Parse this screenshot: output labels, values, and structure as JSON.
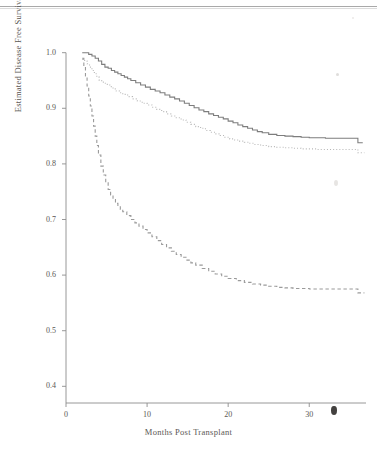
{
  "figure": {
    "name": "kaplan-meier-disease-free-survival",
    "background_color": "#ffffff",
    "artifacts": {
      "page_edge_rule": true,
      "axis_blob_smudge": true
    }
  },
  "chart_data": {
    "type": "line",
    "title": "",
    "subtitle": "",
    "xlabel": "Months Post Transplant",
    "ylabel": "Estimated Disease Free Survival",
    "xlim": [
      0,
      37
    ],
    "ylim": [
      0.37,
      1.03
    ],
    "xticks": [
      0,
      10,
      20,
      30
    ],
    "xtick_labels": [
      "0",
      "10",
      "20",
      "30"
    ],
    "yticks": [
      0.4,
      0.5,
      0.6,
      0.7,
      0.8,
      0.9,
      1.0
    ],
    "ytick_labels": [
      "0.4",
      "0.5",
      "0.6",
      "0.7",
      "0.8",
      "0.9",
      "1.0"
    ],
    "grid": false,
    "legend": "none",
    "step_style": "post",
    "series": [
      {
        "name": "curve-1-solid",
        "style": "solid",
        "color": "#7d7d7d",
        "width": 1.1,
        "x": [
          2.0,
          2.4,
          2.8,
          3.2,
          3.6,
          4.0,
          4.4,
          4.8,
          5.2,
          5.6,
          6.0,
          6.4,
          6.8,
          7.2,
          7.6,
          8.0,
          8.6,
          9.2,
          9.8,
          10.4,
          11.0,
          11.6,
          12.2,
          12.8,
          13.4,
          14.0,
          14.6,
          15.2,
          15.8,
          16.4,
          17.0,
          17.6,
          18.2,
          18.8,
          19.4,
          20.0,
          20.6,
          21.2,
          21.8,
          22.4,
          23.0,
          23.6,
          24.2,
          25.0,
          26.0,
          27.0,
          28.0,
          29.0,
          30.0,
          31.0,
          32.0,
          33.0,
          34.0,
          35.0,
          36.0,
          36.6
        ],
        "y": [
          1.0,
          1.0,
          0.997,
          0.994,
          0.99,
          0.985,
          0.979,
          0.974,
          0.972,
          0.968,
          0.965,
          0.962,
          0.959,
          0.956,
          0.953,
          0.95,
          0.946,
          0.942,
          0.938,
          0.934,
          0.931,
          0.928,
          0.924,
          0.92,
          0.917,
          0.913,
          0.909,
          0.905,
          0.901,
          0.897,
          0.894,
          0.89,
          0.887,
          0.884,
          0.881,
          0.877,
          0.874,
          0.87,
          0.867,
          0.864,
          0.861,
          0.858,
          0.856,
          0.853,
          0.851,
          0.85,
          0.849,
          0.848,
          0.847,
          0.847,
          0.846,
          0.846,
          0.846,
          0.846,
          0.838,
          0.838
        ]
      },
      {
        "name": "curve-2-dotted",
        "style": "dotted",
        "color": "#b6b6b6",
        "width": 1.1,
        "x": [
          2.0,
          2.3,
          2.6,
          2.9,
          3.2,
          3.5,
          3.8,
          4.1,
          4.4,
          4.7,
          5.0,
          5.4,
          5.8,
          6.2,
          6.6,
          7.0,
          7.6,
          8.2,
          8.8,
          9.4,
          10.0,
          10.6,
          11.2,
          11.8,
          12.4,
          13.0,
          13.6,
          14.2,
          14.8,
          15.4,
          16.0,
          16.6,
          17.2,
          17.8,
          18.4,
          19.0,
          19.6,
          20.2,
          20.8,
          21.4,
          22.0,
          22.6,
          23.2,
          24.0,
          25.0,
          26.0,
          27.0,
          28.0,
          29.0,
          30.0,
          31.0,
          32.0,
          33.0,
          34.0,
          35.0,
          36.0,
          36.8
        ],
        "y": [
          0.988,
          0.985,
          0.98,
          0.974,
          0.968,
          0.962,
          0.956,
          0.95,
          0.947,
          0.945,
          0.943,
          0.939,
          0.935,
          0.931,
          0.928,
          0.925,
          0.921,
          0.917,
          0.913,
          0.909,
          0.906,
          0.902,
          0.898,
          0.894,
          0.89,
          0.886,
          0.883,
          0.879,
          0.875,
          0.871,
          0.867,
          0.864,
          0.86,
          0.857,
          0.854,
          0.851,
          0.848,
          0.845,
          0.843,
          0.841,
          0.839,
          0.837,
          0.835,
          0.833,
          0.831,
          0.83,
          0.829,
          0.828,
          0.827,
          0.827,
          0.826,
          0.826,
          0.826,
          0.826,
          0.826,
          0.82,
          0.82
        ]
      },
      {
        "name": "curve-3-dashed",
        "style": "dashed",
        "color": "#9a9a9a",
        "width": 1.1,
        "x": [
          2.0,
          2.2,
          2.4,
          2.6,
          2.8,
          3.0,
          3.2,
          3.4,
          3.6,
          3.8,
          4.0,
          4.3,
          4.6,
          4.9,
          5.2,
          5.5,
          5.8,
          6.1,
          6.4,
          6.7,
          7.0,
          7.5,
          8.0,
          8.5,
          9.0,
          9.5,
          10.0,
          10.6,
          11.2,
          11.8,
          12.4,
          13.0,
          13.6,
          14.2,
          14.8,
          15.4,
          16.0,
          16.8,
          17.6,
          18.4,
          19.2,
          20.0,
          21.0,
          22.0,
          23.0,
          24.0,
          25.0,
          26.0,
          27.0,
          28.0,
          29.0,
          30.0,
          31.0,
          32.0,
          33.0,
          34.0,
          35.0,
          36.0,
          36.8
        ],
        "y": [
          0.99,
          0.975,
          0.958,
          0.94,
          0.922,
          0.904,
          0.886,
          0.868,
          0.85,
          0.833,
          0.816,
          0.796,
          0.78,
          0.766,
          0.754,
          0.744,
          0.736,
          0.729,
          0.723,
          0.718,
          0.714,
          0.707,
          0.7,
          0.694,
          0.688,
          0.682,
          0.676,
          0.669,
          0.662,
          0.655,
          0.649,
          0.643,
          0.637,
          0.632,
          0.627,
          0.622,
          0.618,
          0.612,
          0.607,
          0.602,
          0.598,
          0.594,
          0.59,
          0.587,
          0.584,
          0.582,
          0.58,
          0.578,
          0.577,
          0.576,
          0.576,
          0.575,
          0.575,
          0.575,
          0.575,
          0.575,
          0.575,
          0.568,
          0.568
        ]
      }
    ]
  }
}
